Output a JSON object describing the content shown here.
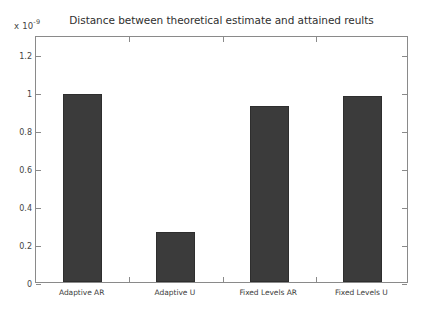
{
  "chart_data": {
    "type": "bar",
    "title": "Distance between theoretical estimate and attained reults",
    "xlabel": "",
    "ylabel": "",
    "exponent_label": {
      "prefix": "x 10",
      "exponent": "-9",
      "full": "x 10^-9"
    },
    "categories": [
      "Adaptive AR",
      "Adaptive U",
      "Fixed Levels AR",
      "Fixed Levels U"
    ],
    "values": [
      0.99,
      0.265,
      0.925,
      0.98
    ],
    "ylim": [
      0,
      1.3
    ],
    "yticks": [
      0,
      0.2,
      0.4,
      0.6,
      0.8,
      1,
      1.2
    ],
    "ytick_labels": [
      "0",
      "0.2",
      "0.4",
      "0.6",
      "0.8",
      "1",
      "1.2"
    ],
    "xlim": [
      0.5,
      4.5
    ],
    "grid": false,
    "legend": null,
    "bar_color": "#3b3b3b",
    "bar_edge_color": "#2e2e2e",
    "axis_color": "#8a8a8a",
    "background_color": "#ffffff",
    "bar_width_fraction": 0.42
  }
}
